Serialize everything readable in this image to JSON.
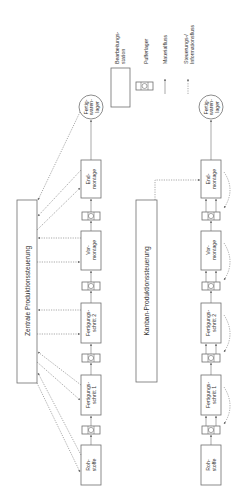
{
  "legend": {
    "station_label_1": "Bearbeitungs-",
    "station_label_2": "station",
    "buffer_label": "Pufferlager",
    "material_label": "Materialfluss",
    "info_label_1": "Steuerungs-/",
    "info_label_2": "Informationsfluss"
  },
  "central": {
    "title": "Zentrale Produktionssteuerung",
    "stations": [
      {
        "l1": "Roh-",
        "l2": "stoffe"
      },
      {
        "l1": "Fertigungs-",
        "l2": "schritt 1"
      },
      {
        "l1": "Fertigungs-",
        "l2": "schritt 2"
      },
      {
        "l1": "Vor-",
        "l2": "montage"
      },
      {
        "l1": "End-",
        "l2": "montage"
      }
    ],
    "store": {
      "l1": "Fertig-",
      "l2": "waren-",
      "l3": "lager"
    }
  },
  "kanban": {
    "title": "Kanban-Produktionssteuerung",
    "stations": [
      {
        "l1": "Roh-",
        "l2": "stoffe"
      },
      {
        "l1": "Fertigungs-",
        "l2": "schritt 1"
      },
      {
        "l1": "Fertigungs-",
        "l2": "schritt 2"
      },
      {
        "l1": "Vor-",
        "l2": "montage"
      },
      {
        "l1": "End-",
        "l2": "montage"
      }
    ],
    "store": {
      "l1": "Fertig-",
      "l2": "waren-",
      "l3": "lager"
    }
  },
  "colors": {
    "stroke": "#6e6e6e",
    "text": "#333333",
    "background": "#ffffff"
  }
}
